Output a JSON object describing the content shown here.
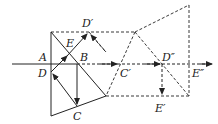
{
  "diagram": {
    "colors": {
      "stroke": "#222222",
      "background": "#ffffff"
    },
    "labels": {
      "A": "A",
      "B": "B",
      "C": "C",
      "D": "D",
      "E": "E",
      "D_prime": "D′",
      "C_prime": "C′",
      "D_double_prime": "D″",
      "E_prime": "E′",
      "E_double_prime": "E″"
    }
  }
}
